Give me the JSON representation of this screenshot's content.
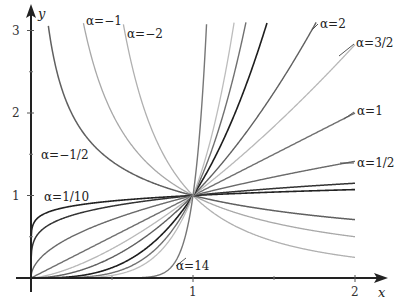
{
  "chart_data": {
    "type": "line",
    "title": "",
    "function": "y = x^alpha",
    "xlabel": "x",
    "ylabel": "y",
    "xlim": [
      0,
      2
    ],
    "ylim": [
      0,
      3
    ],
    "x_ticks": [
      {
        "value": 1,
        "label": "1"
      },
      {
        "value": 2,
        "label": "2"
      }
    ],
    "x_minor_ticks": [
      0.5,
      1.5
    ],
    "y_ticks": [
      {
        "value": 1,
        "label": "1"
      },
      {
        "value": 2,
        "label": "2"
      },
      {
        "value": 3,
        "label": "3"
      }
    ],
    "y_minor_ticks": [
      0.5,
      1.5,
      2.5
    ],
    "grid": false,
    "series": [
      {
        "name": "α=−2",
        "alpha": -2,
        "color": "#b0b0b0",
        "width": 1.3
      },
      {
        "name": "α=−1",
        "alpha": -1,
        "color": "#a8a8a8",
        "width": 1.3
      },
      {
        "name": "α=−1/2",
        "alpha": -0.5,
        "color": "#606060",
        "width": 1.5
      },
      {
        "name": "α=1/10",
        "alpha": 0.1,
        "color": "#222222",
        "width": 1.6
      },
      {
        "name": "α=1/5",
        "alpha": 0.2,
        "color": "#333333",
        "width": 1.5
      },
      {
        "name": "α=1/2",
        "alpha": 0.5,
        "color": "#6a6a6a",
        "width": 1.4
      },
      {
        "name": "α=1",
        "alpha": 1,
        "color": "#707070",
        "width": 1.4
      },
      {
        "name": "α=3/2",
        "alpha": 1.5,
        "color": "#b8b8b8",
        "width": 1.3
      },
      {
        "name": "α=2",
        "alpha": 2,
        "color": "#606060",
        "width": 1.4
      },
      {
        "name": "α=3",
        "alpha": 3,
        "color": "#1e1e1e",
        "width": 1.6
      },
      {
        "name": "α=4",
        "alpha": 4,
        "color": "#707070",
        "width": 1.4
      },
      {
        "name": "α=5",
        "alpha": 5,
        "color": "#bdbdbd",
        "width": 1.3
      },
      {
        "name": "α=14",
        "alpha": 14,
        "color": "#777777",
        "width": 1.4
      }
    ],
    "annotations": [
      {
        "text": "α=−1",
        "x": 86,
        "y": 25,
        "leader": null
      },
      {
        "text": "α=−2",
        "x": 127,
        "y": 38,
        "leader": null
      },
      {
        "text": "α=−1/2",
        "x": 41,
        "y": 159,
        "leader": null
      },
      {
        "text": "α=1/10",
        "x": 44,
        "y": 201,
        "leader": null
      },
      {
        "text": "α=14",
        "x": 176,
        "y": 270,
        "leader": [
          176,
          266,
          186,
          258
        ]
      },
      {
        "text": "α=2",
        "x": 320,
        "y": 28,
        "leader": [
          312,
          30,
          318,
          24
        ]
      },
      {
        "text": "α=3/2",
        "x": 356,
        "y": 47,
        "leader": [
          339,
          56,
          354,
          44
        ]
      },
      {
        "text": "α=1",
        "x": 357,
        "y": 115,
        "leader": [
          344,
          119,
          354,
          112
        ]
      },
      {
        "text": "α=1/2",
        "x": 357,
        "y": 167,
        "leader": [
          340,
          163,
          354,
          163
        ]
      }
    ]
  },
  "axes": {
    "x_label": "x",
    "y_label": "y"
  }
}
